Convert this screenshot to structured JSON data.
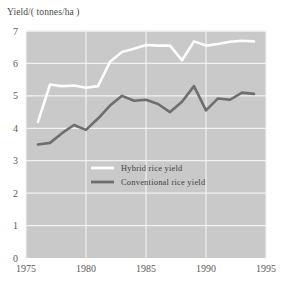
{
  "chart_data": {
    "type": "line",
    "title": "",
    "ylabel": "Yield/( tonnes/ha )",
    "xlabel": "",
    "xlim": [
      1975,
      1995
    ],
    "ylim": [
      0,
      7
    ],
    "grid": true,
    "legend_position": "center-left",
    "xticks": [
      "1975",
      "1980",
      "1985",
      "1990",
      "1995"
    ],
    "xtick_values": [
      1975,
      1980,
      1985,
      1990,
      1995
    ],
    "yticks": [
      "0",
      "1",
      "2",
      "3",
      "4",
      "5",
      "6",
      "7"
    ],
    "ytick_values": [
      0,
      1,
      2,
      3,
      4,
      5,
      6,
      7
    ],
    "x": [
      1976,
      1977,
      1978,
      1979,
      1980,
      1981,
      1982,
      1983,
      1984,
      1985,
      1986,
      1987,
      1988,
      1989,
      1990,
      1991,
      1992,
      1993,
      1994
    ],
    "series": [
      {
        "name": "Hybrid rice yield",
        "color": "#fdfdfd",
        "values": [
          4.2,
          5.35,
          5.3,
          5.32,
          5.25,
          5.3,
          6.05,
          6.35,
          6.45,
          6.57,
          6.55,
          6.55,
          6.1,
          6.68,
          6.55,
          6.6,
          6.67,
          6.7,
          6.68
        ]
      },
      {
        "name": "Conventional rice yield",
        "color": "#6e6e6e",
        "values": [
          3.5,
          3.55,
          3.85,
          4.1,
          3.95,
          4.3,
          4.7,
          5.0,
          4.85,
          4.88,
          4.75,
          4.5,
          4.82,
          5.3,
          4.55,
          4.92,
          4.88,
          5.1,
          5.06
        ]
      }
    ]
  },
  "plot": {
    "background_color": "#c9c9c9",
    "gridline_color": "#f2f2f2"
  },
  "legend": {
    "items": [
      {
        "label": "Hybrid rice yield",
        "swatch_color": "#fdfdfd"
      },
      {
        "label": "Conventional rice yield",
        "swatch_color": "#6e6e6e"
      }
    ]
  }
}
